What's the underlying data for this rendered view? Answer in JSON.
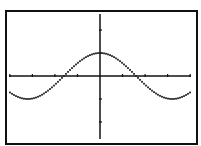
{
  "chart_data": {
    "type": "line",
    "title": "",
    "xlabel": "",
    "ylabel": "",
    "function": "y = cos(x)",
    "series": [
      {
        "name": "Y1",
        "expr": "cos(x)",
        "color": "#222222",
        "style": "dotted"
      }
    ],
    "xlim": [
      -4,
      4
    ],
    "ylim": [
      -3.2,
      2.7
    ],
    "x_tick_spacing": 1,
    "y_tick_spacing": 1,
    "grid": false,
    "legend": "none",
    "key_points": {
      "max": [
        0,
        1
      ],
      "zeros": [
        -1.57,
        1.57
      ],
      "minima": [
        [
          -3.14,
          -1
        ],
        [
          3.14,
          -1
        ]
      ]
    }
  },
  "colors": {
    "frame": "#111111",
    "axis": "#111111",
    "curve": "#222222",
    "background": "#ffffff"
  }
}
